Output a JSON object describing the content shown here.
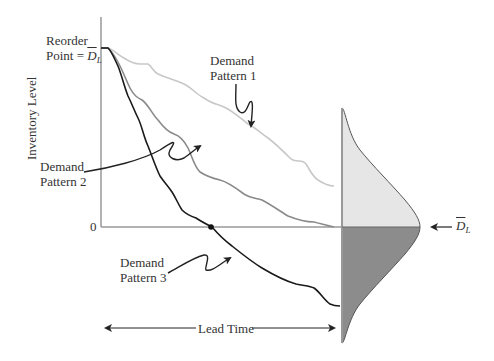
{
  "diagram": {
    "y_axis_label": "Inventory Level",
    "reorder_point": {
      "line1": "Reorder",
      "line2_prefix": "Point = ",
      "symbol": "D",
      "subscript": "L"
    },
    "zero_label": "0",
    "lead_time_label": "Lead Time",
    "mean_demand": {
      "symbol": "D",
      "subscript": "L"
    },
    "patterns": [
      {
        "line1": "Demand",
        "line2": "Pattern 1",
        "color": "#c8c8c8"
      },
      {
        "line1": "Demand",
        "line2": "Pattern 2",
        "color": "#8a8a8a"
      },
      {
        "line1": "Demand",
        "line2": "Pattern 3",
        "color": "#1a1a1a"
      }
    ],
    "distribution": {
      "upper_fill": "#e6e6e6",
      "lower_fill": "#8c8c8c",
      "outline": "#555555"
    },
    "axis_color": "#999999"
  }
}
